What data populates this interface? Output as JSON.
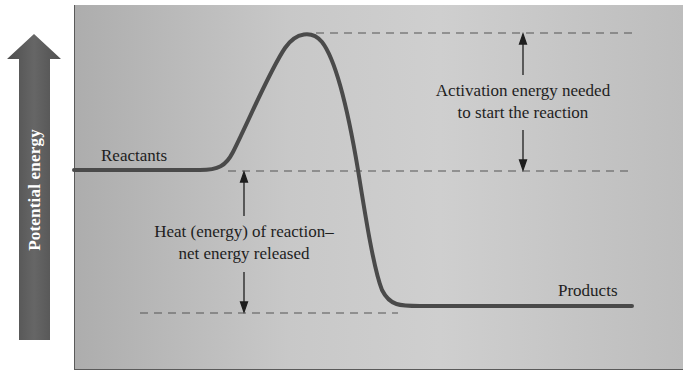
{
  "diagram": {
    "type": "energy-profile",
    "axis": {
      "label": "Potential energy",
      "direction": "up"
    },
    "labels": {
      "reactants": "Reactants",
      "products": "Products",
      "activation_line1": "Activation energy needed",
      "activation_line2": "to start the reaction",
      "heat_line1": "Heat (energy) of reaction–",
      "heat_line2": "net energy released"
    },
    "colors": {
      "panel": "#c4c4c4",
      "curve": "#4a4a4a",
      "arrow": "#555555",
      "text": "#1e1e1e"
    }
  }
}
